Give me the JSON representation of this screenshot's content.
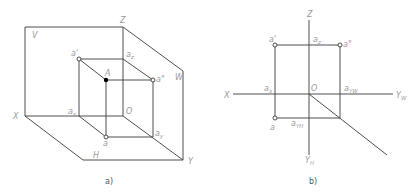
{
  "figure_a": {
    "caption": "a)",
    "planes": {
      "V": "V",
      "W": "W",
      "H": "H"
    },
    "axes": {
      "X": "X",
      "Y": "Y",
      "Z": "Z",
      "origin": "O"
    },
    "points": {
      "A": "A",
      "a_prime": "a'",
      "a_double_prime": "a\"",
      "a": "a",
      "a_x": "a",
      "a_x_sub": "x",
      "a_y": "a",
      "a_y_sub": "y",
      "a_z": "a",
      "a_z_sub": "z"
    }
  },
  "figure_b": {
    "caption": "b)",
    "axes": {
      "X": "X",
      "Z": "Z",
      "Y_W": "Y",
      "Y_W_sub": "W",
      "Y_H": "Y",
      "Y_H_sub": "H",
      "origin": "O"
    },
    "points": {
      "a_prime": "a'",
      "a_double_prime": "a\"",
      "a": "a",
      "a_x": "a",
      "a_x_sub": "x",
      "a_z": "a",
      "a_z_sub": "z",
      "a_YW": "a",
      "a_YW_sub": "YW",
      "a_YH": "a",
      "a_YH_sub": "YH"
    }
  }
}
